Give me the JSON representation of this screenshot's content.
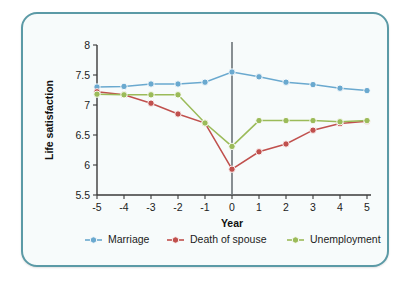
{
  "chart_data": {
    "type": "line",
    "title": "",
    "xlabel": "Year",
    "ylabel": "Life satisfaction",
    "x": [
      -5,
      -4,
      -3,
      -2,
      -1,
      0,
      1,
      2,
      3,
      4,
      5
    ],
    "xticklabels": [
      "-5",
      "-4",
      "-3",
      "-2",
      "-1",
      "0",
      "1",
      "2",
      "3",
      "4",
      "5"
    ],
    "yticks": [
      5.5,
      6,
      6.5,
      7,
      7.5,
      8
    ],
    "yticklabels": [
      "5.5",
      "6",
      "6.5",
      "7",
      "7.5",
      "8"
    ],
    "xlim": [
      -5,
      5
    ],
    "ylim": [
      5.5,
      8
    ],
    "grid": false,
    "legend_position": "bottom",
    "reference_line_x": 0,
    "series": [
      {
        "name": "Marriage",
        "color": "#6aa9cf",
        "values": [
          7.3,
          7.31,
          7.35,
          7.35,
          7.38,
          7.55,
          7.47,
          7.38,
          7.34,
          7.28,
          7.24
        ]
      },
      {
        "name": "Death of spouse",
        "color": "#c0504d",
        "values": [
          7.22,
          7.17,
          7.03,
          6.85,
          6.7,
          5.93,
          6.22,
          6.35,
          6.58,
          6.69,
          6.73
        ]
      },
      {
        "name": "Unemployment",
        "color": "#9bbb59",
        "values": [
          7.18,
          7.17,
          7.17,
          7.17,
          6.7,
          6.31,
          6.74,
          6.74,
          6.74,
          6.72,
          6.74
        ]
      }
    ]
  },
  "frame": {
    "border_color": "#5b9aa6",
    "background_color": "#f7fbfb"
  }
}
